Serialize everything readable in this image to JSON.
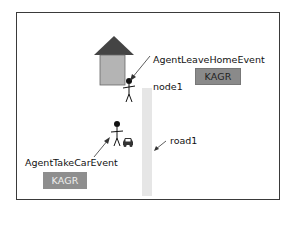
{
  "diagram": {
    "nodes": [
      {
        "id": "house",
        "type": "house-icon"
      },
      {
        "id": "node1",
        "label": "node1"
      },
      {
        "id": "road1",
        "label": "road1"
      }
    ],
    "events": [
      {
        "name": "AgentLeaveHomeEvent",
        "badge": "KAGR",
        "badge_color": "#8a8a8a",
        "badge_text_color": "#222222"
      },
      {
        "name": "AgentTakeCarEvent",
        "badge": "KAGR",
        "badge_color": "#8e8e8e",
        "badge_text_color": "#eeeeee"
      }
    ],
    "colors": {
      "roof": "#444444",
      "wall": "#b4b4b4",
      "road": "#e6e6e6",
      "frame": "#3a3a3a"
    }
  }
}
